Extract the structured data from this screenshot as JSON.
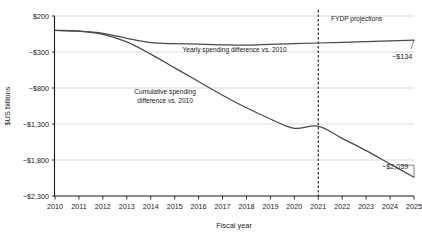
{
  "chart_data": {
    "type": "line",
    "title": "",
    "subtitle": "",
    "xlabel": "Fiscal year",
    "ylabel": "$US billions",
    "x": [
      2010,
      2011,
      2012,
      2013,
      2014,
      2015,
      2016,
      2017,
      2018,
      2019,
      2020,
      2021,
      2022,
      2023,
      2024,
      2025
    ],
    "xlim": [
      2010,
      2025
    ],
    "ylim": [
      -2300,
      200
    ],
    "yticks": [
      200,
      -300,
      -800,
      -1300,
      -1800,
      -2300
    ],
    "ytick_labels": [
      "$200",
      "−$300",
      "−$800",
      "−$1,300",
      "−$1,800",
      "−$2,300"
    ],
    "xtick_labels": [
      "2010",
      "2011",
      "2012",
      "2013",
      "2014",
      "2015",
      "2016",
      "2017",
      "2018",
      "2019",
      "2020",
      "2021",
      "2022",
      "2023",
      "2024",
      "2025"
    ],
    "grid": true,
    "grid_axis": "y",
    "legend": "none",
    "series": [
      {
        "name": "Yearly spending difference vs. 2010",
        "color": "#4a4a4a",
        "values": [
          0,
          -10,
          -40,
          -110,
          -170,
          -185,
          -190,
          -200,
          -205,
          -195,
          -185,
          -175,
          -165,
          -155,
          -145,
          -134
        ],
        "end_label": "−$134"
      },
      {
        "name": "Cumulative spending difference vs. 2010",
        "color": "#4a4a4a",
        "values": [
          0,
          -10,
          -55,
          -160,
          -330,
          -520,
          -710,
          -900,
          -1075,
          -1230,
          -1360,
          -1330,
          -1500,
          -1670,
          -1855,
          -2039
        ],
        "end_label": "−$2,039"
      }
    ],
    "annotations": [
      {
        "name": "fydp-projections",
        "text": "FYDP projections",
        "x": 2022.6,
        "y": 130
      },
      {
        "name": "yearly-series-label",
        "text": "Yearly spending difference vs. 2010",
        "x": 2017.5,
        "y": -305
      },
      {
        "name": "cumulative-series-label-line1",
        "text": "Cumulative spending",
        "x": 2014.6,
        "y": -880
      },
      {
        "name": "cumulative-series-label-line2",
        "text": "difference vs. 2010",
        "x": 2014.6,
        "y": -1010
      }
    ],
    "vertical_divider": {
      "name": "fydp-divider",
      "x": 2021,
      "style": "dashed"
    }
  }
}
